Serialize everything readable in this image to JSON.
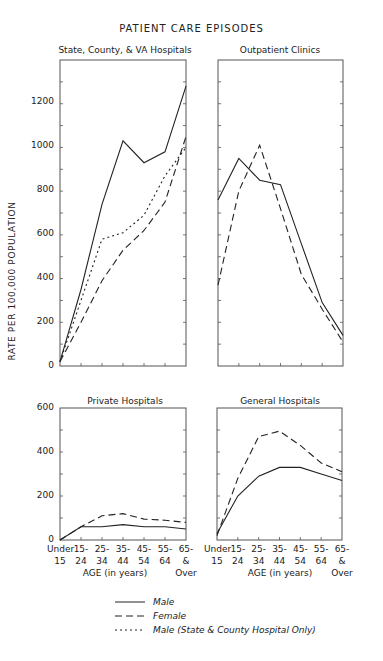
{
  "title": "PATIENT CARE EPISODES",
  "y_axis_label": "RATE PER 100,000 POPULATION",
  "x_axis_label": "AGE (in years)",
  "x_tick_labels": [
    [
      "Under",
      "15"
    ],
    [
      "15-",
      "24"
    ],
    [
      "25-",
      "34"
    ],
    [
      "35-",
      "44"
    ],
    [
      "45-",
      "54"
    ],
    [
      "55-",
      "64"
    ],
    [
      "65-",
      "& Over"
    ]
  ],
  "top_y_ticks": [
    "0",
    "200",
    "400",
    "600",
    "800",
    "1000",
    "1200"
  ],
  "bottom_y_ticks": [
    "0",
    "200",
    "400",
    "600"
  ],
  "legend": [
    {
      "style": "solid",
      "label": "Male"
    },
    {
      "style": "dashed",
      "label": "Female"
    },
    {
      "style": "dotted",
      "label": "Male (State & County Hospital Only)"
    }
  ],
  "colors": {
    "line": "#222222",
    "frame": "#555555"
  },
  "chart_data": [
    {
      "type": "line",
      "title": "State, County, & VA Hospitals",
      "xlabel": "AGE (in years)",
      "ylabel": "RATE PER 100,000 POPULATION",
      "categories": [
        "Under 15",
        "15-24",
        "25-34",
        "35-44",
        "45-54",
        "55-64",
        "65 & Over"
      ],
      "ylim": [
        0,
        1400
      ],
      "series": [
        {
          "name": "Male",
          "values": [
            20,
            350,
            740,
            1030,
            930,
            980,
            1280
          ]
        },
        {
          "name": "Female",
          "values": [
            20,
            200,
            390,
            530,
            620,
            750,
            1050
          ]
        },
        {
          "name": "Male (State & County Hospital Only)",
          "values": [
            20,
            300,
            580,
            610,
            690,
            870,
            1000
          ]
        }
      ]
    },
    {
      "type": "line",
      "title": "Outpatient Clinics",
      "xlabel": "AGE (in years)",
      "ylabel": "RATE PER 100,000 POPULATION",
      "categories": [
        "Under 15",
        "15-24",
        "25-34",
        "35-44",
        "45-54",
        "55-64",
        "65 & Over"
      ],
      "ylim": [
        0,
        1400
      ],
      "series": [
        {
          "name": "Male",
          "values": [
            760,
            950,
            850,
            830,
            560,
            290,
            140
          ]
        },
        {
          "name": "Female",
          "values": [
            370,
            800,
            1010,
            720,
            420,
            260,
            110
          ]
        }
      ]
    },
    {
      "type": "line",
      "title": "Private Hospitals",
      "xlabel": "AGE (in years)",
      "ylabel": "RATE PER 100,000 POPULATION",
      "categories": [
        "Under 15",
        "15-24",
        "25-34",
        "35-44",
        "45-54",
        "55-64",
        "65 & Over"
      ],
      "ylim": [
        0,
        600
      ],
      "series": [
        {
          "name": "Male",
          "values": [
            0,
            60,
            60,
            70,
            60,
            60,
            50
          ]
        },
        {
          "name": "Female",
          "values": [
            0,
            60,
            110,
            120,
            95,
            90,
            80
          ]
        }
      ]
    },
    {
      "type": "line",
      "title": "General Hospitals",
      "xlabel": "AGE (in years)",
      "ylabel": "RATE PER 100,000 POPULATION",
      "categories": [
        "Under 15",
        "15-24",
        "25-34",
        "35-44",
        "45-54",
        "55-64",
        "65 & Over"
      ],
      "ylim": [
        0,
        600
      ],
      "series": [
        {
          "name": "Male",
          "values": [
            30,
            200,
            290,
            330,
            330,
            300,
            270
          ]
        },
        {
          "name": "Female",
          "values": [
            20,
            280,
            470,
            495,
            430,
            350,
            310
          ]
        }
      ]
    }
  ]
}
